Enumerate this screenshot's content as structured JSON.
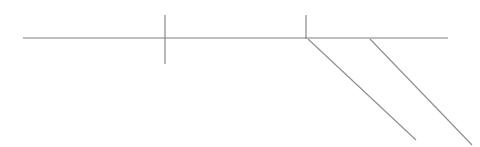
{
  "canvas": {
    "width": 480,
    "height": 147,
    "background_color": "#ffffff",
    "title": ""
  },
  "style": {
    "stroke_color": "#7f7f7f",
    "stroke_color_light": "#8d8d8d",
    "stroke_width": 1.1,
    "stroke_width_thin": 1.0
  },
  "figure": {
    "strokes": [
      {
        "name": "horizontal-baseline",
        "kind": "line",
        "x1": 23,
        "y1": 38,
        "x2": 448,
        "y2": 38,
        "color": "#7f7f7f",
        "width": 1.2
      },
      {
        "name": "tick-mark-left",
        "kind": "line",
        "x1": 165,
        "y1": 15,
        "x2": 165,
        "y2": 64,
        "color": "#7f7f7f",
        "width": 1.1
      },
      {
        "name": "tick-mark-right",
        "kind": "line",
        "x1": 306,
        "y1": 15,
        "x2": 306,
        "y2": 39,
        "color": "#7f7f7f",
        "width": 1.1
      },
      {
        "name": "diagonal-inner",
        "kind": "line",
        "x1": 308,
        "y1": 39,
        "x2": 416,
        "y2": 140,
        "color": "#8d8d8d",
        "width": 1.1
      },
      {
        "name": "diagonal-outer",
        "kind": "line",
        "x1": 370,
        "y1": 39,
        "x2": 472,
        "y2": 145,
        "color": "#8d8d8d",
        "width": 1.1
      }
    ]
  },
  "labels": []
}
